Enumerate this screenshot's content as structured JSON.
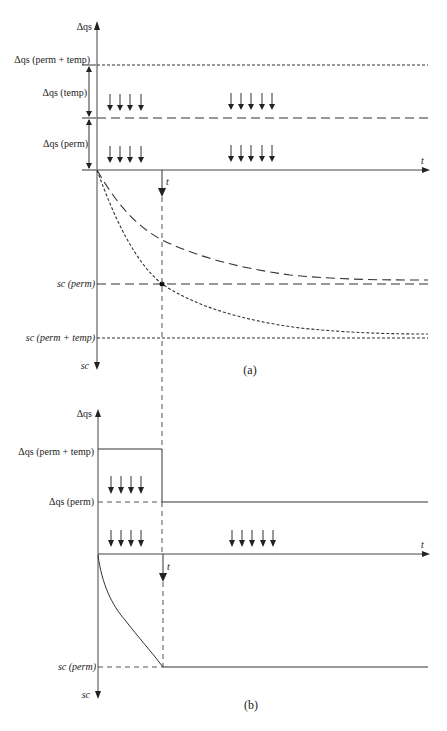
{
  "figure": {
    "panel_a": {
      "caption": "(a)",
      "y_axis_top_label": "Δqs",
      "y_axis_bottom_label": "sc",
      "x_axis_label": "t",
      "time_marker_label": "t",
      "load_labels": {
        "perm_plus_temp": "Δqs (perm + temp)",
        "temp": "Δqs (temp)",
        "perm": "Δqs (perm)"
      },
      "settlement_labels": {
        "perm": "sc (perm)",
        "perm_plus_temp": "sc (perm + temp)"
      },
      "load_arrow_groups": [
        {
          "position": "near-axis",
          "rows": 2,
          "arrows_per_row": 4
        },
        {
          "position": "far",
          "rows": 2,
          "arrows_per_row": 5
        }
      ]
    },
    "panel_b": {
      "caption": "(b)",
      "y_axis_top_label": "Δqs",
      "y_axis_bottom_label": "sc",
      "x_axis_label": "t",
      "time_marker_label": "t",
      "load_labels": {
        "perm_plus_temp": "Δqs (perm + temp)",
        "perm": "Δqs (perm)"
      },
      "settlement_labels": {
        "perm": "sc (perm)"
      },
      "load_arrow_groups": [
        {
          "position": "near-axis",
          "rows": 2,
          "arrows_per_row": 4
        },
        {
          "position": "far",
          "rows": 1,
          "arrows_per_row": 5
        }
      ]
    }
  }
}
